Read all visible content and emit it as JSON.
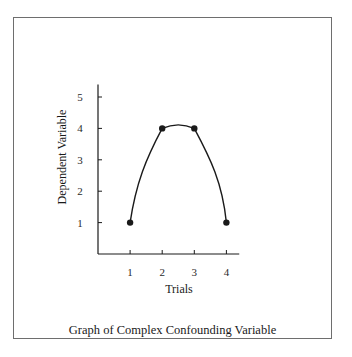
{
  "chart_data": {
    "type": "line",
    "title": "",
    "caption": "Graph of Complex Confounding Variable",
    "xlabel": "Trials",
    "ylabel": "Dependent Variable",
    "x": [
      1,
      2,
      3,
      4
    ],
    "series": [
      {
        "name": "Dependent Variable",
        "values": [
          1,
          4,
          4,
          1
        ],
        "smooth": true,
        "peak_estimate": 4.1
      }
    ],
    "x_ticks": [
      "1",
      "2",
      "3",
      "4"
    ],
    "y_ticks": [
      "1",
      "2",
      "3",
      "4",
      "5"
    ],
    "xlim": [
      0,
      4.4
    ],
    "ylim": [
      0,
      5.4
    ],
    "grid": false,
    "legend": "none",
    "markers": "filled-circle"
  },
  "colors": {
    "line": "#1a1a1a",
    "frame": "#6e6e6e",
    "background": "#ffffff"
  }
}
